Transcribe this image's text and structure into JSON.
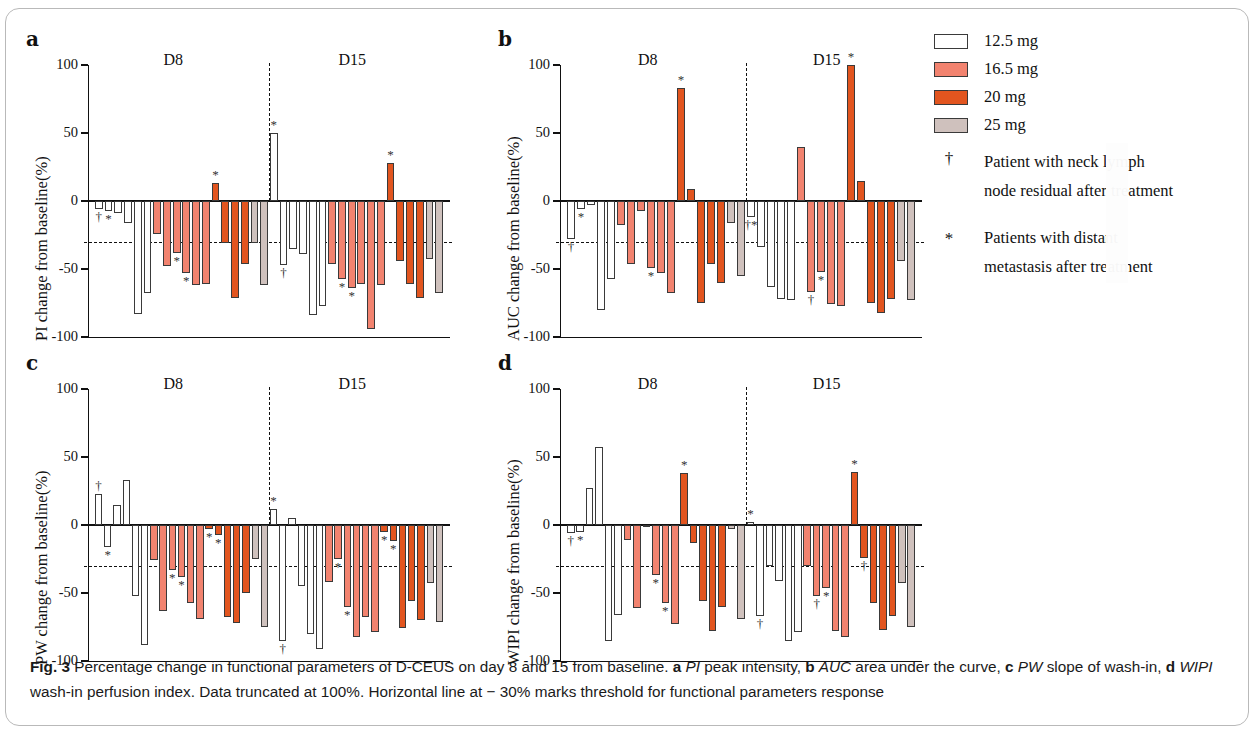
{
  "figure": {
    "id": "Fig. 3",
    "caption_segments": [
      {
        "text": "Fig. 3",
        "style": "bold"
      },
      {
        "text": " Percentage change in functional parameters of D-CEUS on day 8 and 15 from baseline. ",
        "style": "normal"
      },
      {
        "text": "a",
        "style": "bold"
      },
      {
        "text": " ",
        "style": "normal"
      },
      {
        "text": "PI",
        "style": "italic"
      },
      {
        "text": " peak intensity, ",
        "style": "normal"
      },
      {
        "text": "b",
        "style": "bold"
      },
      {
        "text": " ",
        "style": "normal"
      },
      {
        "text": "AUC",
        "style": "italic"
      },
      {
        "text": " area under the curve, ",
        "style": "normal"
      },
      {
        "text": "c",
        "style": "bold"
      },
      {
        "text": " ",
        "style": "normal"
      },
      {
        "text": "PW",
        "style": "italic"
      },
      {
        "text": " slope of wash-in, ",
        "style": "normal"
      },
      {
        "text": "d",
        "style": "bold"
      },
      {
        "text": " ",
        "style": "normal"
      },
      {
        "text": "WIPI",
        "style": "italic"
      },
      {
        "text": " wash-in perfusion index. Data truncated at 100%. Horizontal line at − 30% marks threshold for functional parameters response",
        "style": "normal"
      }
    ]
  },
  "legend": {
    "doses": [
      {
        "label": "12.5 mg",
        "color": "#ffffff"
      },
      {
        "label": "16.5 mg",
        "color": "#f2836f"
      },
      {
        "label": "20 mg",
        "color": "#e2551f"
      },
      {
        "label": "25 mg",
        "color": "#cfc1bd"
      }
    ],
    "notes": [
      {
        "symbol": "†",
        "line1": "Patient with neck lymph",
        "line2": "node residual after treatment"
      },
      {
        "symbol": "*",
        "line1": "Patients with distant",
        "line2": "metastasis after treatment"
      }
    ]
  },
  "chart_data": [
    {
      "panel": "a",
      "type": "bar",
      "title": "PI",
      "ylabel": "PI change from baseline(%)",
      "xlabel": "",
      "ylim": [
        -100,
        100
      ],
      "yticks": [
        100,
        50,
        0,
        -50,
        -100
      ],
      "ytick_labels": [
        "100",
        "50",
        "0",
        "-50",
        "-100"
      ],
      "threshold": -30,
      "grid": false,
      "group_labels": [
        "D8",
        "D15"
      ],
      "series": [
        {
          "name": "D8",
          "dose_groups": [
            {
              "dose": "12.5 mg",
              "color": "#ffffff",
              "values": [
                -6,
                -7,
                -9,
                -16,
                -83,
                -68
              ],
              "markers": [
                "†",
                "*",
                "",
                "",
                "",
                ""
              ]
            },
            {
              "dose": "16.5 mg",
              "color": "#f2836f",
              "values": [
                -24,
                -48,
                -38,
                -53,
                -62,
                -61
              ],
              "markers": [
                "",
                "",
                "*",
                "*",
                "",
                ""
              ]
            },
            {
              "dose": "20 mg",
              "color": "#e2551f",
              "values": [
                13,
                -31,
                -71,
                -46
              ],
              "markers": [
                "*",
                "",
                "",
                ""
              ]
            },
            {
              "dose": "25 mg",
              "color": "#cfc1bd",
              "values": [
                -31,
                -62
              ],
              "markers": [
                "",
                ""
              ]
            }
          ]
        },
        {
          "name": "D15",
          "dose_groups": [
            {
              "dose": "12.5 mg",
              "color": "#ffffff",
              "values": [
                50,
                -47,
                -35,
                -39,
                -84,
                -77
              ],
              "markers": [
                "*",
                "†",
                "",
                "",
                "",
                ""
              ]
            },
            {
              "dose": "16.5 mg",
              "color": "#f2836f",
              "values": [
                -46,
                -57,
                -64,
                -61,
                -94,
                -62
              ],
              "markers": [
                "",
                "*",
                "*",
                "",
                "",
                ""
              ]
            },
            {
              "dose": "20 mg",
              "color": "#e2551f",
              "values": [
                28,
                -44,
                -61,
                -71
              ],
              "markers": [
                "*",
                "",
                "",
                ""
              ]
            },
            {
              "dose": "25 mg",
              "color": "#cfc1bd",
              "values": [
                -43,
                -68
              ],
              "markers": [
                "",
                ""
              ]
            }
          ]
        }
      ]
    },
    {
      "panel": "b",
      "type": "bar",
      "title": "AUC",
      "ylabel": "AUC change from baseline(%)",
      "xlabel": "",
      "ylim": [
        -100,
        100
      ],
      "yticks": [
        100,
        50,
        0,
        -50,
        -100
      ],
      "ytick_labels": [
        "100",
        "50",
        "0",
        "-50",
        "-100"
      ],
      "threshold": -30,
      "grid": false,
      "group_labels": [
        "D8",
        "D15"
      ],
      "series": [
        {
          "name": "D8",
          "dose_groups": [
            {
              "dose": "12.5 mg",
              "color": "#ffffff",
              "values": [
                -28,
                -6,
                -3,
                -80,
                -57
              ],
              "markers": [
                "†",
                "*",
                "",
                "",
                ""
              ]
            },
            {
              "dose": "16.5 mg",
              "color": "#f2836f",
              "values": [
                -18,
                -46,
                -7,
                -49,
                -53,
                -68
              ],
              "markers": [
                "",
                "",
                "",
                "*",
                "",
                ""
              ]
            },
            {
              "dose": "20 mg",
              "color": "#e2551f",
              "values": [
                83,
                9,
                -75,
                -46,
                -60
              ],
              "markers": [
                "*",
                "",
                "",
                "",
                ""
              ]
            },
            {
              "dose": "25 mg",
              "color": "#cfc1bd",
              "values": [
                -16,
                -55
              ],
              "markers": [
                "",
                ""
              ]
            }
          ]
        },
        {
          "name": "D15",
          "dose_groups": [
            {
              "dose": "12.5 mg",
              "color": "#ffffff",
              "values": [
                -12,
                -34,
                -63,
                -72,
                -73
              ],
              "markers": [
                "†*",
                "",
                "",
                "",
                ""
              ]
            },
            {
              "dose": "16.5 mg",
              "color": "#f2836f",
              "values": [
                40,
                -67,
                -52,
                -76,
                -77
              ],
              "markers": [
                "",
                "†",
                "*",
                "",
                ""
              ]
            },
            {
              "dose": "20 mg",
              "color": "#e2551f",
              "values": [
                100,
                15,
                -75,
                -82,
                -72
              ],
              "markers": [
                "*",
                "",
                "",
                "",
                ""
              ]
            },
            {
              "dose": "25 mg",
              "color": "#cfc1bd",
              "values": [
                -44,
                -73
              ],
              "markers": [
                "",
                ""
              ]
            }
          ]
        }
      ]
    },
    {
      "panel": "c",
      "type": "bar",
      "title": "PW",
      "ylabel": "PW change from baseline(%)",
      "xlabel": "",
      "ylim": [
        -100,
        100
      ],
      "yticks": [
        100,
        50,
        0,
        -50,
        -100
      ],
      "ytick_labels": [
        "100",
        "50",
        "0",
        "-50",
        "-100"
      ],
      "threshold": -30,
      "grid": false,
      "group_labels": [
        "D8",
        "D15"
      ],
      "series": [
        {
          "name": "D8",
          "dose_groups": [
            {
              "dose": "12.5 mg",
              "color": "#ffffff",
              "values": [
                23,
                -16,
                15,
                33,
                -52,
                -88
              ],
              "markers": [
                "†",
                "*",
                "",
                "",
                "",
                ""
              ]
            },
            {
              "dose": "16.5 mg",
              "color": "#f2836f",
              "values": [
                -26,
                -63,
                -33,
                -38,
                -57,
                -69
              ],
              "markers": [
                "",
                "",
                "*",
                "*",
                "",
                ""
              ]
            },
            {
              "dose": "20 mg",
              "color": "#e2551f",
              "values": [
                -3,
                -7,
                -68,
                -72,
                -50
              ],
              "markers": [
                "*",
                "*",
                "",
                "",
                ""
              ]
            },
            {
              "dose": "25 mg",
              "color": "#cfc1bd",
              "values": [
                -25,
                -75
              ],
              "markers": [
                "",
                ""
              ]
            }
          ]
        },
        {
          "name": "D15",
          "dose_groups": [
            {
              "dose": "12.5 mg",
              "color": "#ffffff",
              "values": [
                12,
                -85,
                5,
                -45,
                -80,
                -91
              ],
              "markers": [
                "*",
                "†",
                "",
                "",
                "",
                ""
              ]
            },
            {
              "dose": "16.5 mg",
              "color": "#f2836f",
              "values": [
                -42,
                -25,
                -60,
                -82,
                -68,
                -79
              ],
              "markers": [
                "",
                "*",
                "*",
                "",
                "",
                ""
              ]
            },
            {
              "dose": "20 mg",
              "color": "#e2551f",
              "values": [
                -5,
                -12,
                -76,
                -56,
                -70
              ],
              "markers": [
                "*",
                "*",
                "",
                "",
                ""
              ]
            },
            {
              "dose": "25 mg",
              "color": "#cfc1bd",
              "values": [
                -43,
                -71
              ],
              "markers": [
                "",
                ""
              ]
            }
          ]
        }
      ]
    },
    {
      "panel": "d",
      "type": "bar",
      "title": "WIPI",
      "ylabel": "WIPI change from baseline(%)",
      "xlabel": "",
      "ylim": [
        -100,
        100
      ],
      "yticks": [
        100,
        50,
        0,
        -50,
        -100
      ],
      "ytick_labels": [
        "100",
        "50",
        "0",
        "-50",
        "-100"
      ],
      "threshold": -30,
      "grid": false,
      "group_labels": [
        "D8",
        "D15"
      ],
      "series": [
        {
          "name": "D8",
          "dose_groups": [
            {
              "dose": "12.5 mg",
              "color": "#ffffff",
              "values": [
                -6,
                -5,
                27,
                57,
                -85,
                -66
              ],
              "markers": [
                "†",
                "*",
                "",
                "",
                "",
                ""
              ]
            },
            {
              "dose": "16.5 mg",
              "color": "#f2836f",
              "values": [
                -11,
                -61,
                -1,
                -37,
                -57,
                -73
              ],
              "markers": [
                "",
                "",
                "",
                "*",
                "*",
                ""
              ]
            },
            {
              "dose": "20 mg",
              "color": "#e2551f",
              "values": [
                38,
                -13,
                -56,
                -78,
                -60
              ],
              "markers": [
                "*",
                "",
                "",
                "",
                ""
              ]
            },
            {
              "dose": "25 mg",
              "color": "#cfc1bd",
              "values": [
                -3,
                -69
              ],
              "markers": [
                "",
                ""
              ]
            }
          ]
        },
        {
          "name": "D15",
          "dose_groups": [
            {
              "dose": "12.5 mg",
              "color": "#ffffff",
              "values": [
                2,
                -67,
                -30,
                -41,
                -85,
                -79
              ],
              "markers": [
                "*",
                "†",
                "",
                "",
                "",
                ""
              ]
            },
            {
              "dose": "16.5 mg",
              "color": "#f2836f",
              "values": [
                -30,
                -52,
                -46,
                -78,
                -82
              ],
              "markers": [
                "",
                "†",
                "*",
                "",
                ""
              ]
            },
            {
              "dose": "20 mg",
              "color": "#e2551f",
              "values": [
                39,
                -24,
                -57,
                -77,
                -67
              ],
              "markers": [
                "*",
                "†",
                "",
                "",
                ""
              ]
            },
            {
              "dose": "25 mg",
              "color": "#cfc1bd",
              "values": [
                -43,
                -75
              ],
              "markers": [
                "",
                ""
              ]
            }
          ]
        }
      ]
    }
  ]
}
